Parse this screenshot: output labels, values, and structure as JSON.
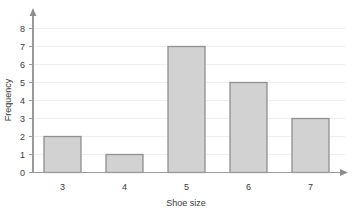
{
  "chart_data": {
    "type": "bar",
    "title": "",
    "xlabel": "Shoe size",
    "ylabel": "Frequency",
    "categories": [
      "3",
      "4",
      "5",
      "6",
      "7"
    ],
    "values": [
      2,
      1,
      7,
      5,
      3
    ],
    "ylim": [
      0,
      8
    ],
    "yticks": [
      "0",
      "1",
      "2",
      "3",
      "4",
      "5",
      "6",
      "7",
      "8"
    ],
    "grid": true,
    "legend": "none",
    "colors": {
      "bar_fill": "#d2d2d2",
      "bar_stroke": "#8f8f8f",
      "gridline": "#efefef",
      "axis": "#9a9a9a",
      "text": "#3a3a3a",
      "background": "#ffffff"
    }
  },
  "axes": {
    "y": {
      "label": "Frequency",
      "ticks": [
        {
          "value": "8"
        },
        {
          "value": "7"
        },
        {
          "value": "6"
        },
        {
          "value": "5"
        },
        {
          "value": "4"
        },
        {
          "value": "3"
        },
        {
          "value": "2"
        },
        {
          "value": "1"
        },
        {
          "value": "0"
        }
      ]
    },
    "x": {
      "label": "Shoe size",
      "ticks": [
        {
          "value": "3"
        },
        {
          "value": "4"
        },
        {
          "value": "5"
        },
        {
          "value": "6"
        },
        {
          "value": "7"
        }
      ]
    }
  },
  "bars": [
    {
      "category": "3",
      "frequency": "2"
    },
    {
      "category": "4",
      "frequency": "1"
    },
    {
      "category": "5",
      "frequency": "7"
    },
    {
      "category": "6",
      "frequency": "5"
    },
    {
      "category": "7",
      "frequency": "3"
    }
  ]
}
